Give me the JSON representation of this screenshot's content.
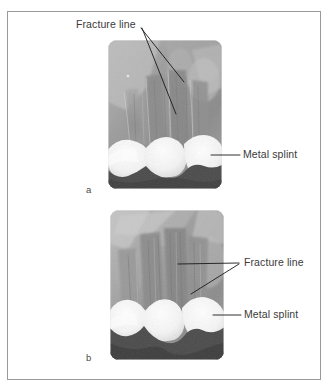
{
  "figure": {
    "border_color": "#9a9a9a",
    "background": "#ffffff",
    "caption_font_color": "#3b3b3b"
  },
  "panels": [
    {
      "id": "a",
      "letter": "a",
      "image_kind": "dental-periapical-radiograph",
      "annotations": [
        {
          "name": "fracture-line-label-a",
          "text": "Fracture line",
          "x": 76,
          "y": 18,
          "leaders": 2
        },
        {
          "name": "metal-splint-label-a",
          "text": "Metal splint",
          "x": 243,
          "y": 147,
          "leaders": 1
        }
      ]
    },
    {
      "id": "b",
      "letter": "b",
      "image_kind": "dental-periapical-radiograph",
      "annotations": [
        {
          "name": "fracture-line-label-b",
          "text": "Fracture line",
          "x": 244,
          "y": 256,
          "leaders": 2
        },
        {
          "name": "metal-splint-label-b",
          "text": "Metal splint",
          "x": 244,
          "y": 307,
          "leaders": 1
        }
      ]
    }
  ],
  "labels": {
    "fracture_line": "Fracture line",
    "metal_splint": "Metal splint",
    "panel_a": "a",
    "panel_b": "b"
  },
  "colors": {
    "leader_line": "#1a1a1a",
    "splint_dark": "#4b4b4b",
    "tooth_bright": "#fbfbfb",
    "bone_mid": "#8d8d8d",
    "bone_light": "#b8b8b8",
    "bone_dark": "#6e6e6e"
  }
}
